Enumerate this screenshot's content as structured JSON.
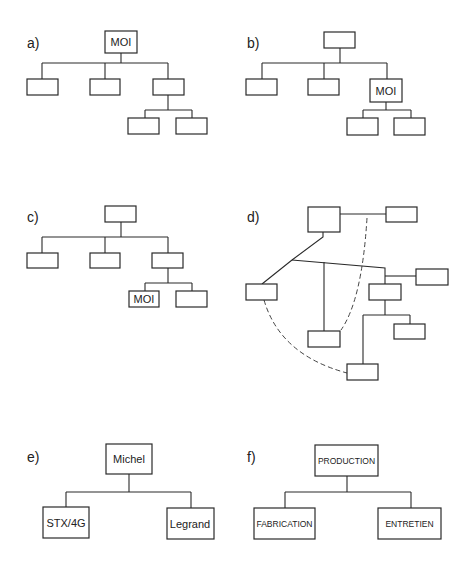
{
  "diagrams": {
    "a": {
      "label": "a)",
      "root": "MOI",
      "description": "MOI at top of hierarchy"
    },
    "b": {
      "label": "b)",
      "middle": "MOI",
      "description": "MOI in middle of hierarchy"
    },
    "c": {
      "label": "c)",
      "bottom": "MOI",
      "description": "MOI at bottom of hierarchy"
    },
    "d": {
      "label": "d)",
      "description": "Network of unlabeled nodes with dashed informal links"
    },
    "e": {
      "label": "e)",
      "root": "Michel",
      "children": [
        "STX/4G",
        "Legrand"
      ]
    },
    "f": {
      "label": "f)",
      "root": "PRODUCTION",
      "children": [
        "FABRICATION",
        "ENTRETIEN"
      ]
    }
  }
}
